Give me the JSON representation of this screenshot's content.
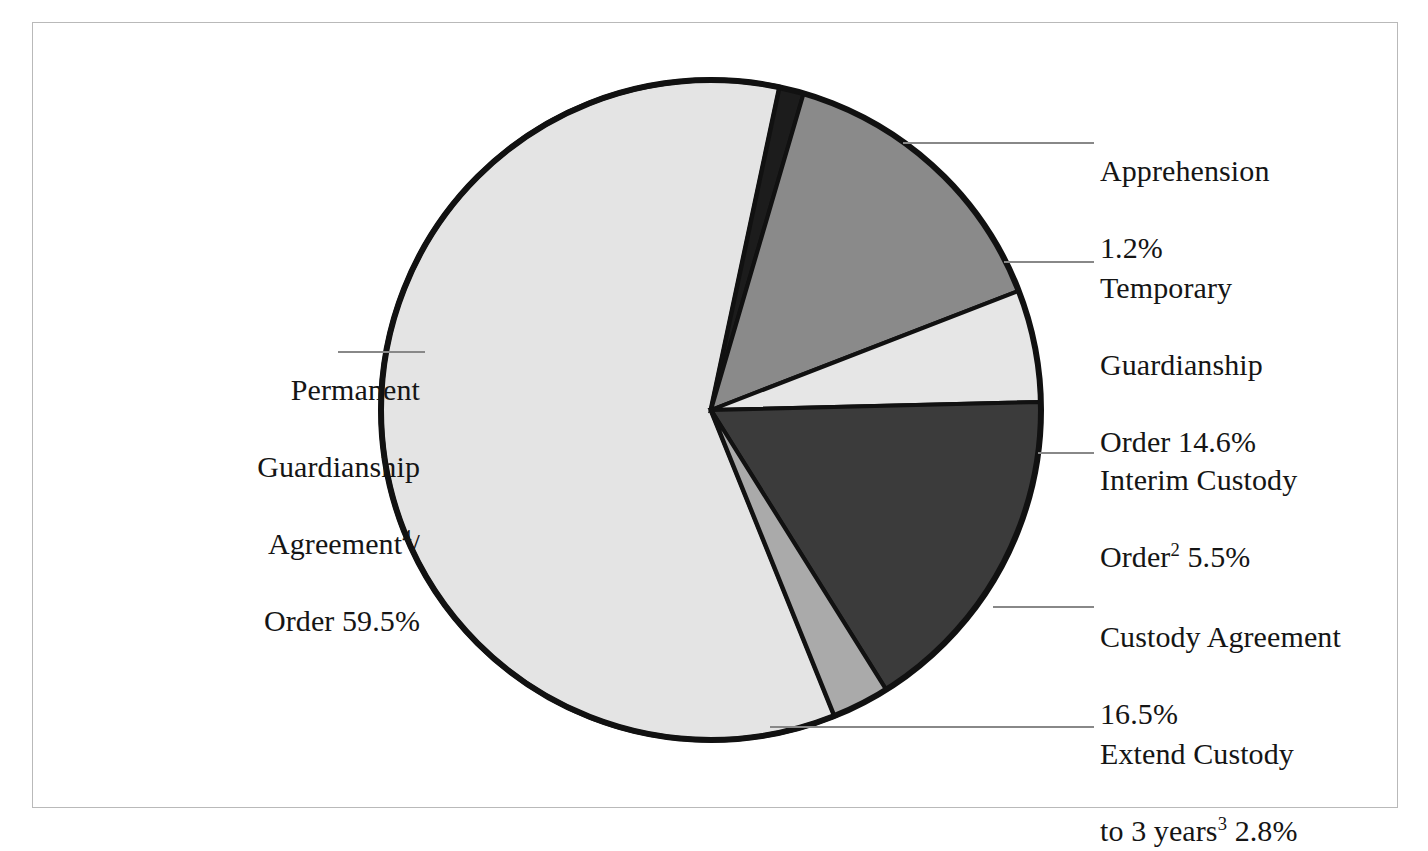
{
  "figure": {
    "background": "#ffffff",
    "frame_border_color": "#b9b9b9"
  },
  "chart_data": {
    "type": "pie",
    "title": "",
    "subtitle": "",
    "xlabel": "",
    "ylabel": "",
    "grid": false,
    "legend_position": "callout-labels",
    "units": "percent",
    "start_angle_deg": 12,
    "direction": "clockwise",
    "center": {
      "x": 711,
      "y": 410
    },
    "radius": 330,
    "categories": [
      "Apprehension",
      "Temporary Guardianship Order",
      "Interim Custody Order2",
      "Custody Agreement",
      "Extend Custody to 3 years3",
      "Permanent Guardianship Agreement4/ Order"
    ],
    "values": [
      1.2,
      14.6,
      5.5,
      16.5,
      2.8,
      59.5
    ],
    "colors": [
      "#1c1c1c",
      "#8a8a8a",
      "#e6e6e6",
      "#3b3b3b",
      "#aaaaaa",
      "#e4e4e4"
    ],
    "slice_border_color": "#111111"
  },
  "slices": {
    "apprehension": {
      "name": "Apprehension",
      "value": 1.2,
      "label_line1": "Apprehension",
      "label_line2": "1.2%",
      "color": "#1c1c1c"
    },
    "temporary_guardianship": {
      "name": "Temporary Guardianship Order",
      "value": 14.6,
      "label_line1": "Temporary",
      "label_line2": "Guardianship",
      "label_line3": "Order 14.6%",
      "color": "#8a8a8a"
    },
    "interim_custody": {
      "name": "Interim Custody Order",
      "value": 5.5,
      "label_line1": "Interim Custody",
      "label_line2_pre": "Order",
      "label_line2_sup": "2",
      "label_line2_post": " 5.5%",
      "color": "#e6e6e6"
    },
    "custody_agreement": {
      "name": "Custody Agreement",
      "value": 16.5,
      "label_line1": "Custody Agreement",
      "label_line2": "16.5%",
      "color": "#3b3b3b"
    },
    "extend_custody": {
      "name": "Extend Custody to 3 years",
      "value": 2.8,
      "label_line1": "Extend Custody",
      "label_line2_pre": "to 3 years",
      "label_line2_sup": "3",
      "label_line2_post": " 2.8%",
      "color": "#aaaaaa"
    },
    "permanent_guardianship": {
      "name": "Permanent Guardianship Agreement / Order",
      "value": 59.5,
      "label_line1": "Permanent",
      "label_line2": "Guardianship",
      "label_line3_pre": "Agreement",
      "label_line3_sup": "4",
      "label_line3_post": "/",
      "label_line4": "Order 59.5%",
      "color": "#e4e4e4"
    }
  }
}
